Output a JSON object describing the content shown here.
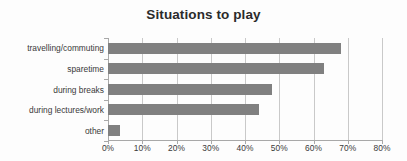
{
  "chart_data": {
    "type": "bar",
    "orientation": "horizontal",
    "title": "Situations to play",
    "xlabel": "",
    "ylabel": "",
    "categories": [
      "travelling/commuting",
      "sparetime",
      "during breaks",
      "during lectures/work",
      "other"
    ],
    "values": [
      68,
      63,
      48,
      44,
      3.5
    ],
    "value_format": "percent",
    "xlim": [
      0,
      80
    ],
    "xticks": [
      0,
      10,
      20,
      30,
      40,
      50,
      60,
      70,
      80
    ],
    "xtick_labels": [
      "0%",
      "10%",
      "20%",
      "30%",
      "40%",
      "50%",
      "60%",
      "70%",
      "80%"
    ],
    "grid": "vertical",
    "legend": "none",
    "bar_color": "#808080",
    "gridline_color": "#c9c9c9",
    "axis_color": "#a8a8a8",
    "background_color": "#fdfdfd",
    "title_color": "#2b2b2b",
    "label_color": "#3a3a3a"
  }
}
